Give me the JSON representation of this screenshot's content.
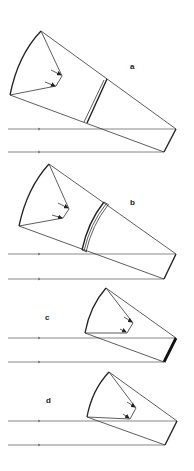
{
  "figure": {
    "panels": [
      {
        "label": "a",
        "corrector": "thin plate lens"
      },
      {
        "label": "b",
        "corrector": "meniscus corrector shell"
      },
      {
        "label": "c",
        "corrector": "thick mirror"
      },
      {
        "label": "d",
        "corrector": "none"
      }
    ]
  },
  "colors": {
    "line": "#333333",
    "background": "#ffffff"
  }
}
